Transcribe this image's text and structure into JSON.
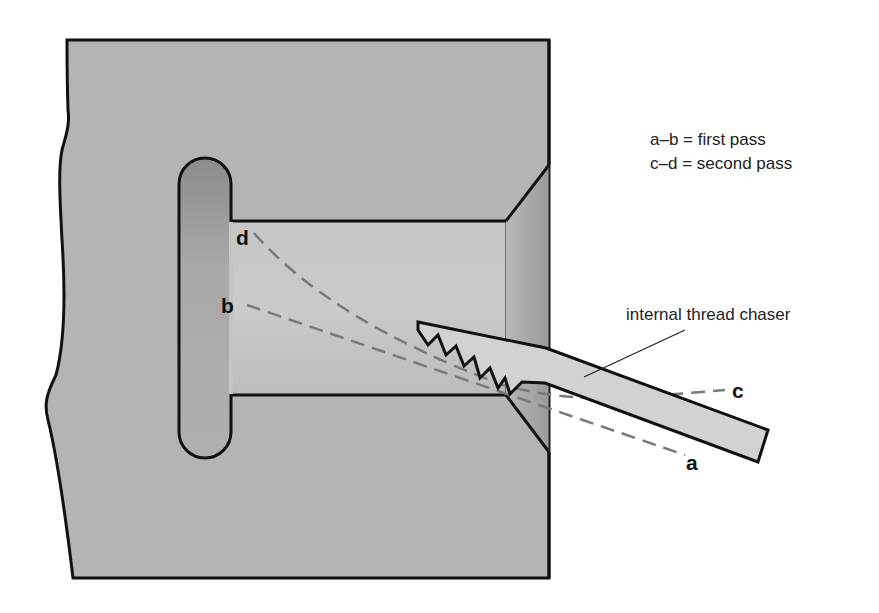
{
  "diagram": {
    "type": "cross-section",
    "legend": [
      {
        "key": "a–b",
        "text": "a–b = first pass"
      },
      {
        "key": "c–d",
        "text": "c–d = second pass"
      }
    ],
    "point_labels": {
      "a": "a",
      "b": "b",
      "c": "c",
      "d": "d"
    },
    "callout": "internal thread chaser",
    "colors": {
      "workpiece": "#b4b4b4",
      "bore": "#c0c0c0",
      "recess": "#a0a0a0",
      "chaser": "#d2d2d2",
      "outline": "#111111",
      "pass_lines": "#7a7a7a"
    }
  }
}
